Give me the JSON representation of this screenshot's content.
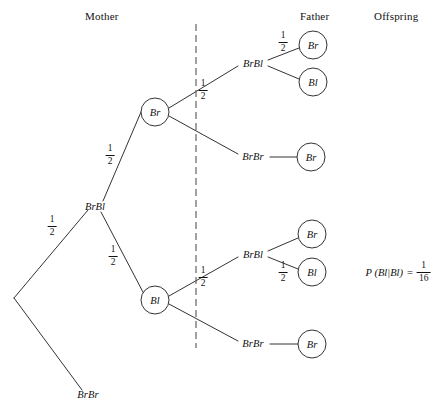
{
  "figure": {
    "type": "probability-tree-diagram",
    "background": "#ffffff",
    "stroke_color": "#333333",
    "text_color": "#111111"
  },
  "headers": {
    "mother": "Mother",
    "father": "Father",
    "offspring": "Offspring"
  },
  "divider": {
    "style": "dashed-vertical",
    "x": 196,
    "y_top": 24,
    "y_bottom": 348
  },
  "nodes": {
    "root": {
      "label": "",
      "x": 14,
      "y": 298
    },
    "mother_brbl": {
      "label": "BrBl",
      "x": 95,
      "y": 206
    },
    "mother_brbr": {
      "label": "BrBr",
      "x": 88,
      "y": 394
    },
    "mother_br_circle": {
      "label": "Br",
      "x": 155,
      "y": 112,
      "r": 14
    },
    "mother_bl_circle": {
      "label": "Bl",
      "x": 155,
      "y": 300,
      "r": 14
    },
    "father_brbl_top": {
      "label": "BrBl",
      "x": 253,
      "y": 63
    },
    "father_brbr_top": {
      "label": "BrBr",
      "x": 253,
      "y": 156
    },
    "father_brbl_bottom": {
      "label": "BrBl",
      "x": 253,
      "y": 254
    },
    "father_brbr_bottom": {
      "label": "BrBr",
      "x": 253,
      "y": 343
    },
    "offspring_br_1": {
      "label": "Br",
      "x": 313,
      "y": 45,
      "r": 14
    },
    "offspring_bl_1": {
      "label": "Bl",
      "x": 313,
      "y": 82,
      "r": 14
    },
    "offspring_br_2": {
      "label": "Br",
      "x": 311,
      "y": 157,
      "r": 14
    },
    "offspring_br_3": {
      "label": "Br",
      "x": 312,
      "y": 234,
      "r": 14
    },
    "offspring_bl_3": {
      "label": "Bl",
      "x": 312,
      "y": 272,
      "r": 14
    },
    "offspring_br_4": {
      "label": "Br",
      "x": 312,
      "y": 344,
      "r": 14
    }
  },
  "probabilities": [
    {
      "id": "p-root-upper",
      "numerator": "1",
      "denominator": "2",
      "x": 52,
      "y": 226
    },
    {
      "id": "p-brbl-to-br",
      "numerator": "1",
      "denominator": "2",
      "x": 110,
      "y": 155
    },
    {
      "id": "p-brbl-to-bl",
      "numerator": "1",
      "denominator": "2",
      "x": 113,
      "y": 256
    },
    {
      "id": "p-br-upper-branch",
      "numerator": "1",
      "denominator": "2",
      "x": 203,
      "y": 90
    },
    {
      "id": "p-bl-upper-branch",
      "numerator": "1",
      "denominator": "2",
      "x": 203,
      "y": 277
    },
    {
      "id": "p-father-br-top",
      "numerator": "1",
      "denominator": "2",
      "x": 283,
      "y": 42
    },
    {
      "id": "p-father-bl-bottom",
      "numerator": "1",
      "denominator": "2",
      "x": 283,
      "y": 272
    }
  ],
  "result": {
    "expression_lhs": "P (Bl|Bl)",
    "equals": "=",
    "numerator": "1",
    "denominator": "16",
    "x": 398,
    "y": 272
  }
}
